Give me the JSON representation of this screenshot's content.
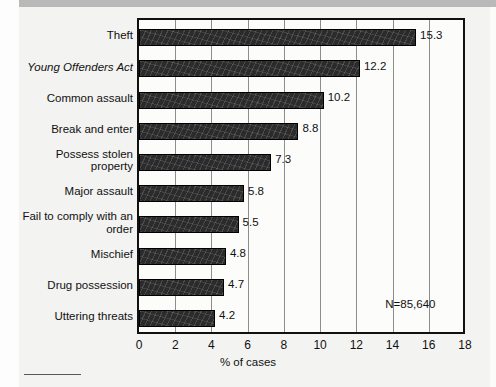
{
  "chart_data": {
    "type": "bar",
    "orientation": "horizontal",
    "title": "",
    "xlabel": "% of cases",
    "ylabel": "",
    "xlim": [
      0,
      18
    ],
    "xticks": [
      0,
      2,
      4,
      6,
      8,
      10,
      12,
      14,
      16,
      18
    ],
    "grid": "vertical",
    "legend": "none",
    "annotation": "N=85,640",
    "categories": [
      "Theft",
      "Young Offenders Act",
      "Common assault",
      "Break and enter",
      "Possess stolen property",
      "Major assault",
      "Fail to comply with an order",
      "Mischief",
      "Drug possession",
      "Uttering threats"
    ],
    "values": [
      15.3,
      12.2,
      10.2,
      8.8,
      7.3,
      5.8,
      5.5,
      4.8,
      4.7,
      4.2
    ],
    "data_labels": [
      "15.3",
      "12.2",
      "10.2",
      "8.8",
      "7.3",
      "5.8",
      "5.5",
      "4.8",
      "4.7",
      "4.2"
    ]
  },
  "styles": {
    "bar_color": "#2b2b2b",
    "grid_color": "#8d8d8d",
    "frame_color": "#111111",
    "page_background": "#f3f3f1",
    "plot_background": "#fcfcfb",
    "band_color": "#b9b9b9"
  },
  "axis": {
    "tick_labels": [
      "0",
      "2",
      "4",
      "6",
      "8",
      "10",
      "12",
      "14",
      "16",
      "18"
    ],
    "title": "% of cases"
  },
  "note": {
    "text": "N=85,640"
  },
  "categories_meta": [
    {
      "label": "Theft",
      "italic": false,
      "lines": 1
    },
    {
      "label": "Young Offenders Act",
      "italic": true,
      "lines": 1
    },
    {
      "label": "Common assault",
      "italic": false,
      "lines": 1
    },
    {
      "label": "Break and enter",
      "italic": false,
      "lines": 1
    },
    {
      "label": "Possess stolen property",
      "italic": false,
      "lines": 2
    },
    {
      "label": "Major assault",
      "italic": false,
      "lines": 1
    },
    {
      "label": "Fail to comply with an order",
      "italic": false,
      "lines": 2
    },
    {
      "label": "Mischief",
      "italic": false,
      "lines": 1
    },
    {
      "label": "Drug possession",
      "italic": false,
      "lines": 1
    },
    {
      "label": "Uttering threats",
      "italic": false,
      "lines": 1
    }
  ]
}
